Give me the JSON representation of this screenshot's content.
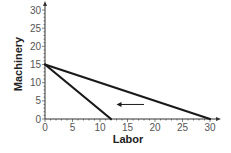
{
  "chart_data": {
    "type": "line",
    "title": "",
    "xlabel": "Labor",
    "ylabel": "Machinery",
    "xlim": [
      0,
      30
    ],
    "ylim": [
      0,
      30
    ],
    "x_ticks": [
      0,
      5,
      10,
      15,
      20,
      25,
      30
    ],
    "y_ticks": [
      0,
      5,
      10,
      15,
      20,
      25,
      30
    ],
    "grid": false,
    "series": [
      {
        "name": "Isocost line 1",
        "points": [
          [
            0,
            15
          ],
          [
            30,
            0
          ]
        ]
      },
      {
        "name": "Isocost line 2",
        "points": [
          [
            0,
            15
          ],
          [
            12,
            0
          ]
        ]
      }
    ],
    "annotations": [
      {
        "type": "arrow",
        "from": [
          18,
          4
        ],
        "to": [
          13,
          4
        ],
        "label": ""
      }
    ]
  },
  "style": {
    "line_color": "#1a1a1a",
    "axis_color": "#333333",
    "text_color": "#555555"
  }
}
